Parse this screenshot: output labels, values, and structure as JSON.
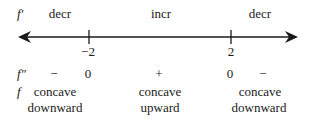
{
  "diagram": {
    "type": "sign-chart-number-line",
    "rows": {
      "first_derivative": {
        "label": "f′",
        "intervals": [
          "decr",
          "incr",
          "decr"
        ]
      },
      "second_derivative": {
        "label": "f″",
        "signs": [
          "−",
          "0",
          "+",
          "0",
          "−"
        ]
      },
      "function": {
        "label": "f",
        "concavity_line1": [
          "concave",
          "concave",
          "concave"
        ],
        "concavity_line2": [
          "downward",
          "upward",
          "downward"
        ]
      }
    },
    "number_line": {
      "ticks": [
        "−2",
        "2"
      ],
      "arrows": [
        "left",
        "right"
      ],
      "color": "#1a1a1a"
    }
  }
}
